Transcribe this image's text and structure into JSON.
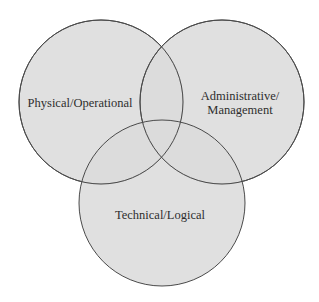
{
  "diagram": {
    "type": "venn",
    "colors": {
      "fill": "#dadada",
      "stroke": "#4a4a4a",
      "text": "#2e2e2e",
      "background": "#ffffff"
    },
    "sets": [
      {
        "id": "physical",
        "label": "Physical/Operational",
        "lines": [
          "Physical/Operational"
        ]
      },
      {
        "id": "administrative",
        "label": "Administrative/Management",
        "lines": [
          "Administrative/",
          "Management"
        ]
      },
      {
        "id": "technical",
        "label": "Technical/Logical",
        "lines": [
          "Technical/Logical"
        ]
      }
    ]
  }
}
